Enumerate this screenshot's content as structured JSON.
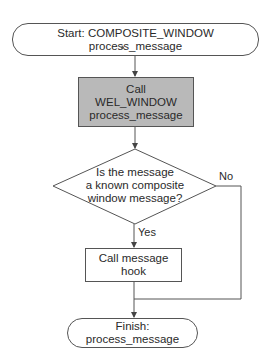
{
  "diagram": {
    "type": "flowchart",
    "nodes": {
      "start": {
        "shape": "terminator",
        "text": "Start: COMPOSITE_WINDOW process_message"
      },
      "call_wel": {
        "shape": "process",
        "lines": [
          "Call",
          "WEL_WINDOW",
          "process_message"
        ],
        "fill": "#b9b9b9"
      },
      "decision": {
        "shape": "decision",
        "lines": [
          "Is the message",
          "a known composite",
          "window message?"
        ]
      },
      "call_hook": {
        "shape": "process",
        "lines": [
          "Call message",
          "hook"
        ]
      },
      "finish": {
        "shape": "terminator",
        "text": "Finish: process_message"
      }
    },
    "edges": [
      {
        "from": "start",
        "to": "call_wel",
        "label": ""
      },
      {
        "from": "call_wel",
        "to": "decision",
        "label": ""
      },
      {
        "from": "decision",
        "to": "call_hook",
        "label": "Yes"
      },
      {
        "from": "decision",
        "to": "finish",
        "label": "No"
      },
      {
        "from": "call_hook",
        "to": "finish",
        "label": ""
      }
    ],
    "labels": {
      "yes": "Yes",
      "no": "No"
    },
    "colors": {
      "stroke": "#555555",
      "shaded_fill": "#b9b9b9",
      "background": "#ffffff"
    }
  }
}
